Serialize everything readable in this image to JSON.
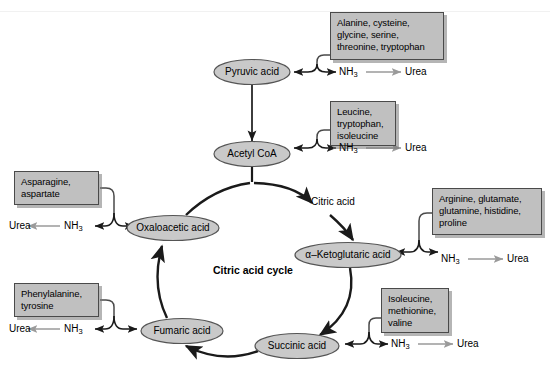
{
  "diagram": {
    "title": "Citric acid cycle",
    "cycle_center_label": "Citric acid cycle",
    "colors": {
      "box_fill": "#c0c0c0",
      "box_border": "#4a4a4a",
      "node_fill": "#c9c9c9",
      "node_border": "#555555",
      "arrow_black": "#1a1a1a",
      "arrow_gray": "#9a9a9a",
      "background": "#ffffff"
    }
  },
  "nodes": {
    "pyruvic_acid": "Pyruvic acid",
    "acetyl_coa": "Acetyl CoA",
    "citric_acid": "Citric acid",
    "oxaloacetic_acid": "Oxaloacetic acid",
    "ketoglutaric_acid": "α–Ketoglutaric acid",
    "succinic_acid": "Succinic acid",
    "fumaric_acid": "Fumaric acid"
  },
  "amino_acid_boxes": {
    "pyruvate_group": "Alanine, cysteine,\nglycine, serine,\nthreonine, tryptophan",
    "acetyl_coa_group": "Leucine,\ntryptophan,\nisoleucine",
    "ketoglutarate_group": "Arginine, glutamate,\nglutamine, histidine,\nproline",
    "succinate_group": "Isoleucine,\nmethionine,\nvaline",
    "oxaloacetate_group": "Asparagine,\naspartate",
    "fumarate_group": "Phenylalanine,\ntyrosine"
  },
  "products": {
    "ammonia": "NH",
    "ammonia_sub": "3",
    "urea": "Urea"
  },
  "product_pairs": [
    {
      "id": "pyruvate-products",
      "ammonia": "NH",
      "sub": "3",
      "urea": "Urea"
    },
    {
      "id": "acetylcoa-products",
      "ammonia": "NH",
      "sub": "3",
      "urea": "Urea"
    },
    {
      "id": "ketoglutarate-products",
      "ammonia": "NH",
      "sub": "3",
      "urea": "Urea"
    },
    {
      "id": "succinate-products",
      "ammonia": "NH",
      "sub": "3",
      "urea": "Urea"
    },
    {
      "id": "oxaloacetate-products",
      "ammonia": "NH",
      "sub": "3",
      "urea": "Urea"
    },
    {
      "id": "fumarate-products",
      "ammonia": "NH",
      "sub": "3",
      "urea": "Urea"
    }
  ]
}
